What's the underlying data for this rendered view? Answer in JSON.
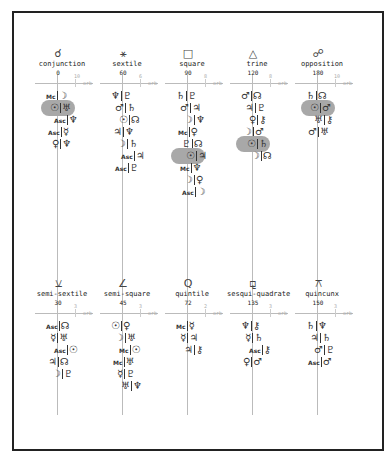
{
  "diagram": {
    "orb_axis_label": "orb",
    "rows": [
      {
        "aspects": [
          {
            "name": "conjunction",
            "glyph": "☌",
            "angle": "0",
            "orb_tick": "10",
            "pairs": [
              {
                "a": "Mc",
                "b": "☽",
                "highlight": false
              },
              {
                "a": "☉",
                "b": "♅",
                "highlight": true
              },
              {
                "a": "Asc",
                "b": "♆",
                "highlight": false
              },
              {
                "a": "Asc",
                "b": "☿",
                "highlight": false
              },
              {
                "a": "♀",
                "b": "♆",
                "highlight": false
              }
            ]
          },
          {
            "name": "sextile",
            "glyph": "⚹",
            "angle": "60",
            "orb_tick": "6",
            "pairs": [
              {
                "a": "♆",
                "b": "♇",
                "highlight": false
              },
              {
                "a": "♂",
                "b": "♄",
                "highlight": false
              },
              {
                "a": "☉",
                "b": "☊",
                "highlight": false
              },
              {
                "a": "♃",
                "b": "♆",
                "highlight": false
              },
              {
                "a": "☽",
                "b": "♄",
                "highlight": false
              },
              {
                "a": "Asc",
                "b": "♃",
                "highlight": false
              },
              {
                "a": "Asc",
                "b": "♇",
                "highlight": false
              }
            ]
          },
          {
            "name": "square",
            "glyph": "□",
            "angle": "90",
            "orb_tick": "8",
            "pairs": [
              {
                "a": "♄",
                "b": "♇",
                "highlight": false
              },
              {
                "a": "♂",
                "b": "♃",
                "highlight": false
              },
              {
                "a": "☽",
                "b": "♆",
                "highlight": false
              },
              {
                "a": "Mc",
                "b": "♀",
                "highlight": false
              },
              {
                "a": "♇",
                "b": "☊",
                "highlight": false
              },
              {
                "a": "☉",
                "b": "♃",
                "highlight": true
              },
              {
                "a": "Mc",
                "b": "♆",
                "highlight": false
              },
              {
                "a": "☽",
                "b": "♀",
                "highlight": false
              },
              {
                "a": "Asc",
                "b": "☽",
                "highlight": false
              }
            ]
          },
          {
            "name": "trine",
            "glyph": "△",
            "angle": "120",
            "orb_tick": "8",
            "pairs": [
              {
                "a": "♂",
                "b": "☊",
                "highlight": false
              },
              {
                "a": "♃",
                "b": "♇",
                "highlight": false
              },
              {
                "a": "♀",
                "b": "⚷",
                "highlight": false
              },
              {
                "a": "☽",
                "b": "♂",
                "highlight": false
              },
              {
                "a": "☉",
                "b": "♄",
                "highlight": true
              },
              {
                "a": "☽",
                "b": "☊",
                "highlight": false
              }
            ]
          },
          {
            "name": "opposition",
            "glyph": "☍",
            "angle": "180",
            "orb_tick": "10",
            "pairs": [
              {
                "a": "♄",
                "b": "☊",
                "highlight": false
              },
              {
                "a": "☉",
                "b": "♂",
                "highlight": true
              },
              {
                "a": "♅",
                "b": "⚷",
                "highlight": false
              },
              {
                "a": "♂",
                "b": "♅",
                "highlight": false
              }
            ]
          }
        ]
      },
      {
        "aspects": [
          {
            "name": "semi-sextile",
            "glyph": "⚺",
            "angle": "30",
            "orb_tick": "3",
            "pairs": [
              {
                "a": "Asc",
                "b": "☊",
                "highlight": false
              },
              {
                "a": "☿",
                "b": "♅",
                "highlight": false
              },
              {
                "a": "Asc",
                "b": "☉",
                "highlight": false
              },
              {
                "a": "♃",
                "b": "☊",
                "highlight": false
              },
              {
                "a": "☽",
                "b": "♇",
                "highlight": false
              }
            ]
          },
          {
            "name": "semi-square",
            "glyph": "∠",
            "angle": "45",
            "orb_tick": "3",
            "pairs": [
              {
                "a": "☉",
                "b": "♀",
                "highlight": false
              },
              {
                "a": "☽",
                "b": "♅",
                "highlight": false
              },
              {
                "a": "Mc",
                "b": "☉",
                "highlight": false
              },
              {
                "a": "Mc",
                "b": "♅",
                "highlight": false
              },
              {
                "a": "☿",
                "b": "♇",
                "highlight": false
              },
              {
                "a": "♅",
                "b": "♆",
                "highlight": false
              }
            ]
          },
          {
            "name": "quintile",
            "glyph": "Q",
            "angle": "72",
            "orb_tick": "2",
            "pairs": [
              {
                "a": "Mc",
                "b": "☿",
                "highlight": false
              },
              {
                "a": "☿",
                "b": "♃",
                "highlight": false
              },
              {
                "a": "♃",
                "b": "⚷",
                "highlight": false
              }
            ]
          },
          {
            "name": "sesqui-quadrate",
            "glyph": "⚼",
            "angle": "135",
            "orb_tick": "3",
            "pairs": [
              {
                "a": "♆",
                "b": "⚷",
                "highlight": false
              },
              {
                "a": "☿",
                "b": "♄",
                "highlight": false
              },
              {
                "a": "Asc",
                "b": "⚷",
                "highlight": false
              },
              {
                "a": "♀",
                "b": "♂",
                "highlight": false
              }
            ]
          },
          {
            "name": "quincunx",
            "glyph": "⚻",
            "angle": "150",
            "orb_tick": "3",
            "pairs": [
              {
                "a": "♄",
                "b": "♆",
                "highlight": false
              },
              {
                "a": "♃",
                "b": "♄",
                "highlight": false
              },
              {
                "a": "♂",
                "b": "♇",
                "highlight": false
              },
              {
                "a": "Asc",
                "b": "♂",
                "highlight": false
              }
            ]
          }
        ]
      }
    ]
  }
}
